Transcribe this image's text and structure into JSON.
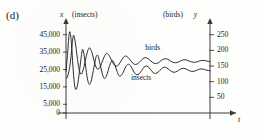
{
  "figure": {
    "panel_id": "(d)",
    "left_axis_title_var": "x",
    "left_axis_title_units": "(insects)",
    "right_axis_title_units": "(birds)",
    "right_axis_title_var": "y",
    "time_axis_label": "t",
    "curve_color": "#222222",
    "axis_color": "#3a3a3a"
  },
  "chart_data": {
    "type": "line",
    "title": "",
    "subtitle": "",
    "xlabel": "t",
    "ylabel": "x (insects)",
    "y2label": "y (birds)",
    "grid": false,
    "legend": "inline-annotations",
    "xlim": [
      0,
      1
    ],
    "ylim": [
      0,
      50000
    ],
    "y2lim": [
      0,
      277.8
    ],
    "left_ticks": [
      "0",
      "5,000",
      "15,000",
      "25,000",
      "35,000",
      "45,000"
    ],
    "left_tick_values": [
      0,
      5000,
      15000,
      25000,
      35000,
      45000
    ],
    "right_ticks": [
      "50",
      "100",
      "150",
      "200",
      "250"
    ],
    "right_tick_values": [
      50,
      100,
      150,
      200,
      250
    ],
    "annotations": [
      {
        "text": "birds",
        "x": 0.62,
        "y": 205
      },
      {
        "text": "insects",
        "x": 0.52,
        "y": 110
      }
    ],
    "series": [
      {
        "name": "insects",
        "axis": "left",
        "units": "insects",
        "points": [
          [
            0.0,
            24000
          ],
          [
            0.01,
            33000
          ],
          [
            0.02,
            44000
          ],
          [
            0.028,
            46500
          ],
          [
            0.038,
            40000
          ],
          [
            0.048,
            27000
          ],
          [
            0.058,
            17000
          ],
          [
            0.068,
            13500
          ],
          [
            0.08,
            16000
          ],
          [
            0.092,
            23000
          ],
          [
            0.104,
            31000
          ],
          [
            0.114,
            36500
          ],
          [
            0.124,
            34000
          ],
          [
            0.136,
            27000
          ],
          [
            0.148,
            20000
          ],
          [
            0.16,
            16500
          ],
          [
            0.172,
            17500
          ],
          [
            0.184,
            22000
          ],
          [
            0.198,
            28000
          ],
          [
            0.21,
            32500
          ],
          [
            0.222,
            33000
          ],
          [
            0.234,
            29000
          ],
          [
            0.248,
            24000
          ],
          [
            0.26,
            20500
          ],
          [
            0.272,
            20000
          ],
          [
            0.286,
            22500
          ],
          [
            0.3,
            26500
          ],
          [
            0.314,
            29500
          ],
          [
            0.326,
            30000
          ],
          [
            0.34,
            27500
          ],
          [
            0.354,
            24000
          ],
          [
            0.368,
            21500
          ],
          [
            0.382,
            21500
          ],
          [
            0.398,
            23500
          ],
          [
            0.414,
            26500
          ],
          [
            0.43,
            28000
          ],
          [
            0.444,
            27500
          ],
          [
            0.46,
            25500
          ],
          [
            0.476,
            23000
          ],
          [
            0.492,
            22000
          ],
          [
            0.508,
            22500
          ],
          [
            0.526,
            24500
          ],
          [
            0.544,
            26500
          ],
          [
            0.56,
            27000
          ],
          [
            0.578,
            26000
          ],
          [
            0.596,
            24000
          ],
          [
            0.614,
            22800
          ],
          [
            0.632,
            23000
          ],
          [
            0.652,
            24500
          ],
          [
            0.672,
            26000
          ],
          [
            0.69,
            26300
          ],
          [
            0.71,
            25300
          ],
          [
            0.73,
            24000
          ],
          [
            0.75,
            23400
          ],
          [
            0.772,
            24000
          ],
          [
            0.794,
            25200
          ],
          [
            0.816,
            25700
          ],
          [
            0.838,
            25100
          ],
          [
            0.86,
            24200
          ],
          [
            0.882,
            23900
          ],
          [
            0.904,
            24400
          ],
          [
            0.928,
            25200
          ],
          [
            0.95,
            25300
          ],
          [
            0.972,
            24700
          ],
          [
            1.0,
            24300
          ]
        ]
      },
      {
        "name": "birds",
        "axis": "right",
        "units": "birds",
        "points": [
          [
            0.0,
            110
          ],
          [
            0.012,
            118
          ],
          [
            0.026,
            148
          ],
          [
            0.036,
            185
          ],
          [
            0.044,
            225
          ],
          [
            0.052,
            248
          ],
          [
            0.062,
            232
          ],
          [
            0.074,
            192
          ],
          [
            0.086,
            152
          ],
          [
            0.098,
            128
          ],
          [
            0.11,
            126
          ],
          [
            0.124,
            146
          ],
          [
            0.138,
            176
          ],
          [
            0.152,
            200
          ],
          [
            0.164,
            208
          ],
          [
            0.178,
            196
          ],
          [
            0.192,
            172
          ],
          [
            0.206,
            150
          ],
          [
            0.22,
            140
          ],
          [
            0.236,
            146
          ],
          [
            0.25,
            162
          ],
          [
            0.266,
            180
          ],
          [
            0.28,
            190
          ],
          [
            0.296,
            186
          ],
          [
            0.312,
            172
          ],
          [
            0.328,
            158
          ],
          [
            0.344,
            150
          ],
          [
            0.362,
            152
          ],
          [
            0.378,
            163
          ],
          [
            0.396,
            176
          ],
          [
            0.412,
            182
          ],
          [
            0.43,
            178
          ],
          [
            0.448,
            168
          ],
          [
            0.466,
            158
          ],
          [
            0.484,
            155
          ],
          [
            0.502,
            159
          ],
          [
            0.522,
            168
          ],
          [
            0.542,
            176
          ],
          [
            0.56,
            176
          ],
          [
            0.58,
            170
          ],
          [
            0.6,
            162
          ],
          [
            0.62,
            158
          ],
          [
            0.64,
            160
          ],
          [
            0.662,
            168
          ],
          [
            0.684,
            173
          ],
          [
            0.704,
            172
          ],
          [
            0.726,
            166
          ],
          [
            0.748,
            161
          ],
          [
            0.77,
            161
          ],
          [
            0.794,
            166
          ],
          [
            0.816,
            170
          ],
          [
            0.838,
            169
          ],
          [
            0.86,
            165
          ],
          [
            0.884,
            162
          ],
          [
            0.908,
            163
          ],
          [
            0.932,
            167
          ],
          [
            0.956,
            168
          ],
          [
            0.978,
            166
          ],
          [
            1.0,
            164
          ]
        ]
      }
    ]
  }
}
